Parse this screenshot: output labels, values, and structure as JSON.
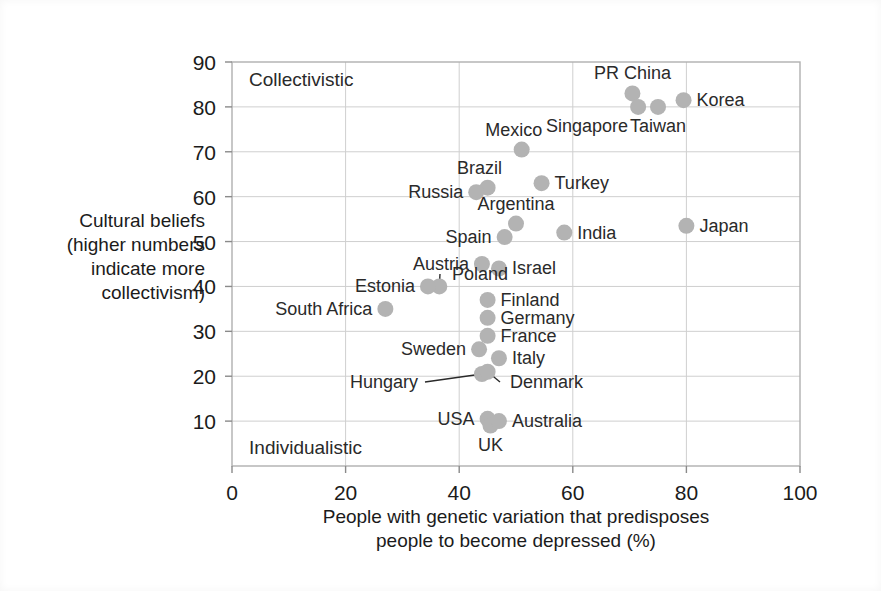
{
  "chart_data": {
    "type": "scatter",
    "title": "",
    "xlabel": "People with genetic variation that predisposes people to become depressed (%)",
    "xlabel_line1": "People with genetic variation that predisposes",
    "xlabel_line2": "people to become depressed (%)",
    "ylabel": "Cultural beliefs (higher numbers indicate more collectivism)",
    "ylabel_lines": [
      "Cultural beliefs",
      "(higher numbers",
      "indicate more",
      "collectivism)"
    ],
    "xlim": [
      0,
      100
    ],
    "ylim": [
      0,
      90
    ],
    "xticks": [
      0,
      20,
      40,
      60,
      80,
      100
    ],
    "yticks": [
      10,
      20,
      30,
      40,
      50,
      60,
      70,
      80,
      90
    ],
    "grid": true,
    "legend": "none",
    "annotations": [
      {
        "name": "collectivistic-corner-label",
        "text": "Collectivistic",
        "x": 3,
        "y": 86
      },
      {
        "name": "individualistic-corner-label",
        "text": "Individualistic",
        "x": 3,
        "y": 4
      }
    ],
    "marker_color": "#b3b3b3",
    "grid_color": "#cfcfcf",
    "frame_color": "#b0b0b0",
    "text_color": "#2a2a2a",
    "points": [
      {
        "label": "PR China",
        "x": 70.5,
        "y": 83.0,
        "label_pos": "above",
        "leader": false
      },
      {
        "label": "Singapore",
        "x": 71.5,
        "y": 80.0,
        "label_pos": "below-left",
        "leader": false
      },
      {
        "label": "Taiwan",
        "x": 75.0,
        "y": 80.0,
        "label_pos": "below",
        "leader": false
      },
      {
        "label": "Korea",
        "x": 79.5,
        "y": 81.5,
        "label_pos": "right",
        "leader": false
      },
      {
        "label": "Mexico",
        "x": 51.0,
        "y": 70.5,
        "label_pos": "above-left",
        "leader": false
      },
      {
        "label": "Turkey",
        "x": 54.5,
        "y": 63.0,
        "label_pos": "right",
        "leader": false
      },
      {
        "label": "Brazil",
        "x": 45.0,
        "y": 62.0,
        "label_pos": "above-left",
        "leader": false
      },
      {
        "label": "Russia",
        "x": 43.0,
        "y": 61.0,
        "label_pos": "left",
        "leader": false
      },
      {
        "label": "Argentina",
        "x": 50.0,
        "y": 54.0,
        "label_pos": "above",
        "leader": false
      },
      {
        "label": "Japan",
        "x": 80.0,
        "y": 53.5,
        "label_pos": "right",
        "leader": false
      },
      {
        "label": "India",
        "x": 58.5,
        "y": 52.0,
        "label_pos": "right",
        "leader": false
      },
      {
        "label": "Spain",
        "x": 48.0,
        "y": 51.0,
        "label_pos": "left",
        "leader": false
      },
      {
        "label": "Austria",
        "x": 44.0,
        "y": 45.0,
        "label_pos": "left",
        "leader": false
      },
      {
        "label": "Israel",
        "x": 47.0,
        "y": 44.0,
        "label_pos": "right",
        "leader": false
      },
      {
        "label": "Poland",
        "x": 36.5,
        "y": 40.0,
        "label_pos": "leader",
        "leader": true
      },
      {
        "label": "Estonia",
        "x": 34.5,
        "y": 40.0,
        "label_pos": "left",
        "leader": false
      },
      {
        "label": "Finland",
        "x": 45.0,
        "y": 37.0,
        "label_pos": "right",
        "leader": false
      },
      {
        "label": "South Africa",
        "x": 27.0,
        "y": 35.0,
        "label_pos": "left",
        "leader": false
      },
      {
        "label": "Germany",
        "x": 45.0,
        "y": 33.0,
        "label_pos": "right",
        "leader": false
      },
      {
        "label": "France",
        "x": 45.0,
        "y": 29.0,
        "label_pos": "right",
        "leader": false
      },
      {
        "label": "Sweden",
        "x": 43.5,
        "y": 26.0,
        "label_pos": "left",
        "leader": false
      },
      {
        "label": "Italy",
        "x": 47.0,
        "y": 24.0,
        "label_pos": "right",
        "leader": false
      },
      {
        "label": "Hungary",
        "x": 44.0,
        "y": 20.5,
        "label_pos": "leader",
        "leader": true
      },
      {
        "label": "Denmark",
        "x": 45.0,
        "y": 21.0,
        "label_pos": "leader",
        "leader": true
      },
      {
        "label": "USA",
        "x": 45.0,
        "y": 10.5,
        "label_pos": "left",
        "leader": false
      },
      {
        "label": "UK",
        "x": 45.5,
        "y": 9.0,
        "label_pos": "below",
        "leader": false
      },
      {
        "label": "Australia",
        "x": 47.0,
        "y": 10.0,
        "label_pos": "right",
        "leader": false
      }
    ]
  }
}
